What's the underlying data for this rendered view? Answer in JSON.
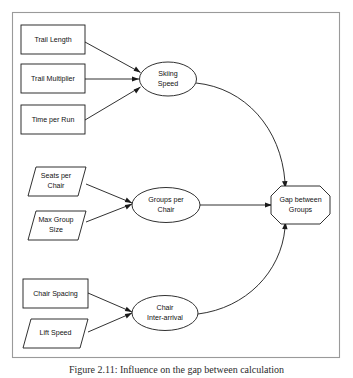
{
  "figure": {
    "caption": "Figure 2.11: Influence on the gap between calculation",
    "frame": {
      "border_color": "#9a9a9a"
    },
    "colors": {
      "stroke": "#1a1a1a",
      "fill": "#ffffff",
      "frame": "#9a9a9a",
      "text": "#111111"
    }
  },
  "diagram": {
    "type": "influence-diagram",
    "nodes": [
      {
        "id": "trail-length",
        "label": "Trail Length",
        "shape": "rectangle",
        "group": "skiing-speed-inputs"
      },
      {
        "id": "trail-multiplier",
        "label": "Trail Multiplier",
        "shape": "rectangle",
        "group": "skiing-speed-inputs"
      },
      {
        "id": "time-per-run",
        "label": "Time per Run",
        "shape": "rectangle",
        "group": "skiing-speed-inputs"
      },
      {
        "id": "seats-per-chair",
        "label": "Seats per Chair",
        "shape": "parallelogram",
        "group": "groups-per-chair-inputs"
      },
      {
        "id": "max-group-size",
        "label": "Max Group Size",
        "shape": "parallelogram",
        "group": "groups-per-chair-inputs"
      },
      {
        "id": "chair-spacing",
        "label": "Chair Spacing",
        "shape": "rectangle",
        "group": "chair-interarrival-inputs"
      },
      {
        "id": "lift-speed",
        "label": "Lift Speed",
        "shape": "parallelogram",
        "group": "chair-interarrival-inputs"
      },
      {
        "id": "skiing-speed",
        "label": "Skiing Speed",
        "shape": "ellipse",
        "group": "intermediate"
      },
      {
        "id": "groups-per-chair",
        "label": "Groups per Chair",
        "shape": "ellipse",
        "group": "intermediate"
      },
      {
        "id": "chair-interarrival",
        "label": "Chair Inter-arrival",
        "shape": "ellipse",
        "group": "intermediate"
      },
      {
        "id": "gap-between-groups",
        "label": "Gap between Groups",
        "shape": "octagon",
        "group": "output"
      }
    ],
    "edges": [
      {
        "from": "trail-length",
        "to": "skiing-speed",
        "style": "straight"
      },
      {
        "from": "trail-multiplier",
        "to": "skiing-speed",
        "style": "straight"
      },
      {
        "from": "time-per-run",
        "to": "skiing-speed",
        "style": "straight"
      },
      {
        "from": "seats-per-chair",
        "to": "groups-per-chair",
        "style": "straight"
      },
      {
        "from": "max-group-size",
        "to": "groups-per-chair",
        "style": "straight"
      },
      {
        "from": "chair-spacing",
        "to": "chair-interarrival",
        "style": "straight"
      },
      {
        "from": "lift-speed",
        "to": "chair-interarrival",
        "style": "straight"
      },
      {
        "from": "skiing-speed",
        "to": "gap-between-groups",
        "style": "curved"
      },
      {
        "from": "groups-per-chair",
        "to": "gap-between-groups",
        "style": "straight"
      },
      {
        "from": "chair-interarrival",
        "to": "gap-between-groups",
        "style": "curved"
      }
    ],
    "labels": {
      "trail_length": "Trail Length",
      "trail_multiplier": "Trail Multiplier",
      "time_per_run": "Time per Run",
      "seats_per_chair_line1": "Seats per",
      "seats_per_chair_line2": "Chair",
      "max_group_size_line1": "Max Group",
      "max_group_size_line2": "Size",
      "chair_spacing": "Chair Spacing",
      "lift_speed": "Lift Speed",
      "skiing_speed_line1": "Skiing",
      "skiing_speed_line2": "Speed",
      "groups_per_chair_line1": "Groups per",
      "groups_per_chair_line2": "Chair",
      "chair_interarrival_line1": "Chair",
      "chair_interarrival_line2": "Inter-arrival",
      "gap_between_groups_line1": "Gap between",
      "gap_between_groups_line2": "Groups"
    }
  }
}
